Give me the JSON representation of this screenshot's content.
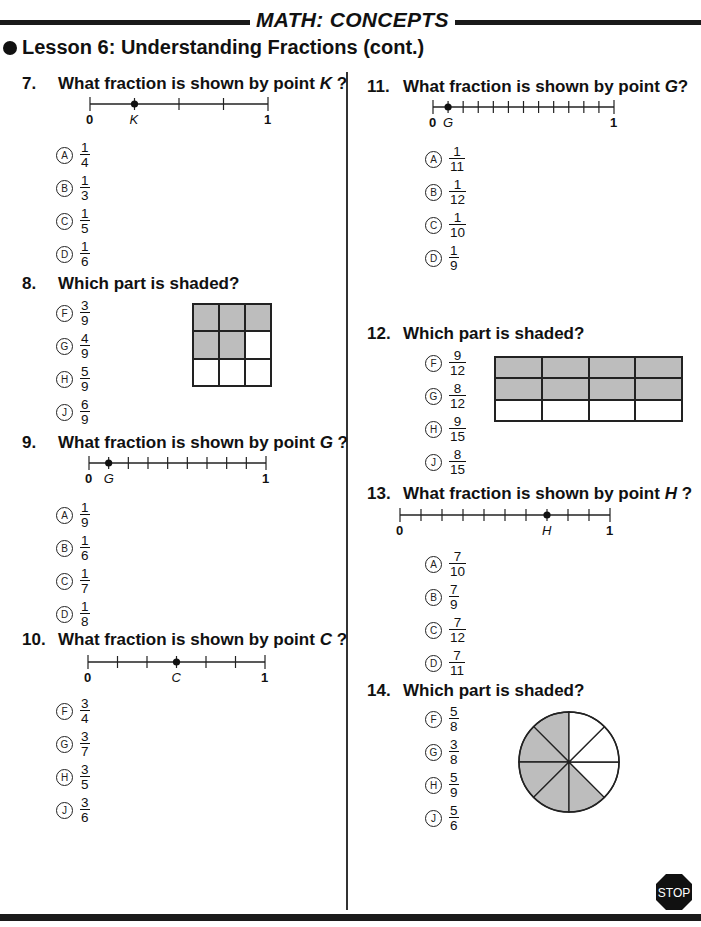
{
  "header": {
    "section_title": "MATH: CONCEPTS",
    "lesson_title": "Lesson 6: Understanding Fractions (cont.)"
  },
  "questions": [
    {
      "number": "7.",
      "prompt": "What fraction is shown by point",
      "point": "K",
      "suffix": " ?",
      "type": "number-line",
      "number_line": {
        "start": "0",
        "end": "1",
        "segments": 4,
        "point_index": 1
      },
      "options": [
        {
          "letter": "A",
          "num": "1",
          "den": "4"
        },
        {
          "letter": "B",
          "num": "1",
          "den": "3"
        },
        {
          "letter": "C",
          "num": "1",
          "den": "5"
        },
        {
          "letter": "D",
          "num": "1",
          "den": "6"
        }
      ]
    },
    {
      "number": "8.",
      "prompt": "Which part is shaded?",
      "type": "grid",
      "grid": {
        "rows": 3,
        "cols": 3,
        "shaded": [
          1,
          1,
          1,
          1,
          1,
          0,
          0,
          0,
          0
        ]
      },
      "options": [
        {
          "letter": "F",
          "num": "3",
          "den": "9"
        },
        {
          "letter": "G",
          "num": "4",
          "den": "9"
        },
        {
          "letter": "H",
          "num": "5",
          "den": "9"
        },
        {
          "letter": "J",
          "num": "6",
          "den": "9"
        }
      ]
    },
    {
      "number": "9.",
      "prompt": "What fraction is shown by point",
      "point": "G",
      "suffix": " ?",
      "type": "number-line",
      "number_line": {
        "start": "0",
        "end": "1",
        "segments": 9,
        "point_index": 1
      },
      "options": [
        {
          "letter": "A",
          "num": "1",
          "den": "9"
        },
        {
          "letter": "B",
          "num": "1",
          "den": "6"
        },
        {
          "letter": "C",
          "num": "1",
          "den": "7"
        },
        {
          "letter": "D",
          "num": "1",
          "den": "8"
        }
      ]
    },
    {
      "number": "10.",
      "prompt": "What fraction is shown by point",
      "point": "C",
      "suffix": " ?",
      "type": "number-line",
      "number_line": {
        "start": "0",
        "end": "1",
        "segments": 6,
        "point_index": 3
      },
      "options": [
        {
          "letter": "F",
          "num": "3",
          "den": "4"
        },
        {
          "letter": "G",
          "num": "3",
          "den": "7"
        },
        {
          "letter": "H",
          "num": "3",
          "den": "5"
        },
        {
          "letter": "J",
          "num": "3",
          "den": "6"
        }
      ]
    },
    {
      "number": "11.",
      "prompt": "What fraction is shown by point",
      "point": "G",
      "suffix": "?",
      "type": "number-line",
      "number_line": {
        "start": "0",
        "end": "1",
        "segments": 12,
        "point_index": 1
      },
      "options": [
        {
          "letter": "A",
          "num": "1",
          "den": "11"
        },
        {
          "letter": "B",
          "num": "1",
          "den": "12"
        },
        {
          "letter": "C",
          "num": "1",
          "den": "10"
        },
        {
          "letter": "D",
          "num": "1",
          "den": "9"
        }
      ]
    },
    {
      "number": "12.",
      "prompt": "Which part is shaded?",
      "type": "grid",
      "grid": {
        "rows": 3,
        "cols": 4,
        "shaded": [
          1,
          1,
          1,
          1,
          1,
          1,
          1,
          1,
          0,
          0,
          0,
          0
        ]
      },
      "options": [
        {
          "letter": "F",
          "num": "9",
          "den": "12"
        },
        {
          "letter": "G",
          "num": "8",
          "den": "12"
        },
        {
          "letter": "H",
          "num": "9",
          "den": "15"
        },
        {
          "letter": "J",
          "num": "8",
          "den": "15"
        }
      ]
    },
    {
      "number": "13.",
      "prompt": "What fraction is shown by point",
      "point": "H",
      "suffix": " ?",
      "type": "number-line",
      "number_line": {
        "start": "0",
        "end": "1",
        "segments": 10,
        "point_index": 7
      },
      "options": [
        {
          "letter": "A",
          "num": "7",
          "den": "10"
        },
        {
          "letter": "B",
          "num": "7",
          "den": "9"
        },
        {
          "letter": "C",
          "num": "7",
          "den": "12"
        },
        {
          "letter": "D",
          "num": "7",
          "den": "11"
        }
      ]
    },
    {
      "number": "14.",
      "prompt": "Which part is shaded?",
      "type": "pie",
      "pie": {
        "slices": 8,
        "shaded_count": 5
      },
      "options": [
        {
          "letter": "F",
          "num": "5",
          "den": "8"
        },
        {
          "letter": "G",
          "num": "3",
          "den": "8"
        },
        {
          "letter": "H",
          "num": "5",
          "den": "9"
        },
        {
          "letter": "J",
          "num": "5",
          "den": "6"
        }
      ]
    }
  ],
  "footer": {
    "stop_label": "STOP"
  },
  "colors": {
    "ink": "#111111",
    "shade": "#bdbdbd",
    "paper": "#ffffff"
  }
}
